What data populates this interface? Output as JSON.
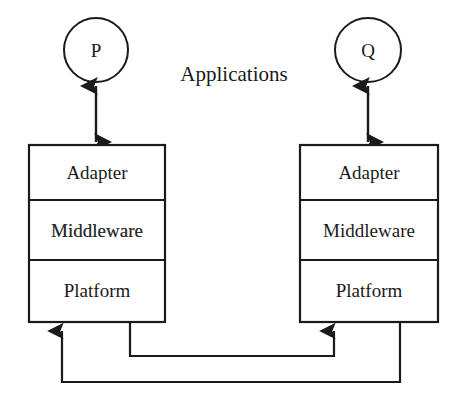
{
  "diagram": {
    "group_label": "Applications",
    "stroke_color": "#1a1a1a",
    "fill_color": "#ffffff",
    "applications": [
      {
        "id": "app-p",
        "label": "P",
        "cx": 96,
        "cy": 50,
        "rx": 32,
        "ry": 32
      },
      {
        "id": "app-q",
        "label": "Q",
        "cx": 368,
        "cy": 50,
        "rx": 33,
        "ry": 32
      }
    ],
    "stacks": [
      {
        "id": "stack-left",
        "x": 29,
        "y": 145,
        "width": 136,
        "height": 177,
        "layers": [
          {
            "id": "adapter",
            "label": "Adapter"
          },
          {
            "id": "middleware",
            "label": "Middleware"
          },
          {
            "id": "platform",
            "label": "Platform"
          }
        ]
      },
      {
        "id": "stack-right",
        "x": 300,
        "y": 145,
        "width": 138,
        "height": 177,
        "layers": [
          {
            "id": "adapter",
            "label": "Adapter"
          },
          {
            "id": "middleware",
            "label": "Middleware"
          },
          {
            "id": "platform",
            "label": "Platform"
          }
        ]
      }
    ],
    "connectors": [
      {
        "id": "connector-p-to-left-stack",
        "kind": "double-arrow",
        "from": "app-p",
        "to": "stack-left"
      },
      {
        "id": "connector-q-to-right-stack",
        "kind": "double-arrow",
        "from": "app-q",
        "to": "stack-right"
      },
      {
        "id": "connector-left-platform-to-right-platform",
        "kind": "single-arrow",
        "from": "stack-left",
        "to": "stack-right"
      },
      {
        "id": "connector-right-platform-to-left-platform",
        "kind": "single-arrow",
        "from": "stack-right",
        "to": "stack-left"
      }
    ]
  }
}
